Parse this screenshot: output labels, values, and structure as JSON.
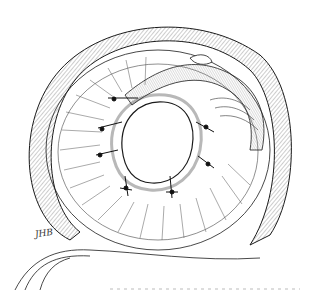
{
  "figure": {
    "type": "pen-and-ink medical illustration",
    "signature": "JHB",
    "suture_count": 7,
    "colors": {
      "ink": "#1a1a1a",
      "shade": "#8a8a8a",
      "paper": "#ffffff"
    }
  }
}
